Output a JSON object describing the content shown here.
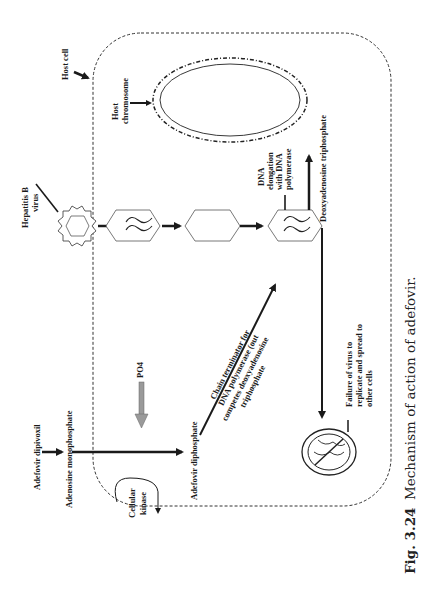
{
  "figure": {
    "orientation": "rotated 90 degrees counter-clockwise",
    "caption": {
      "number": "Fig. 3.24",
      "text": "Mechanism of action of adefovir."
    }
  },
  "labels": {
    "host_cell": "Host cell",
    "host_chromosome_1": "Host",
    "host_chromosome_2": "chromosome",
    "hbv_1": "Hepatitis B",
    "hbv_2": "virus",
    "dna_elong_1": "DNA",
    "dna_elong_2": "elongation",
    "dna_elong_3": "with DNA",
    "dna_elong_4": "polymerase",
    "datp": "Deoxyadenosine triphosphate",
    "adefovir_dipivoxil": "Adefovir dipivoxil",
    "adenosine_mp": "Adenosine monophosphate",
    "po4": "PO4",
    "cellular_kinase_1": "Cellular",
    "cellular_kinase_2": "kinase",
    "adefovir_dp": "Adefovir diphosphate",
    "chain_term_1": "Chain terminator for",
    "chain_term_2": "DNA polymerase (out",
    "chain_term_3": "competes deoxyadenosine",
    "chain_term_4": "triphosphate",
    "failure_1": "Failure of virus to",
    "failure_2": "replicate and spread to",
    "failure_3": "other cells"
  },
  "colors": {
    "ink": "#1a1a1a",
    "outline": "#555555",
    "po4_arrow": "#9a9a9a"
  }
}
